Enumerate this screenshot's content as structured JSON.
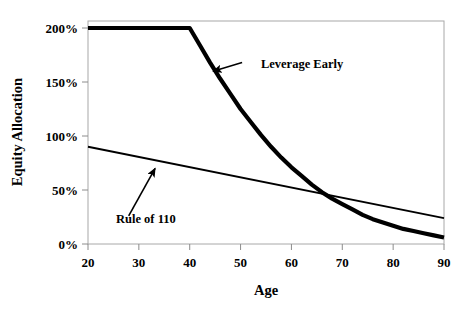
{
  "chart_data": {
    "type": "line",
    "title": "",
    "xlabel": "Age",
    "ylabel": "Equity Allocation",
    "xlim": [
      20,
      90
    ],
    "ylim": [
      0,
      200
    ],
    "grid": false,
    "legend_position": "none",
    "x_ticks": [
      20,
      30,
      40,
      50,
      60,
      70,
      80,
      90
    ],
    "x_tick_labels": [
      "20",
      "30",
      "40",
      "50",
      "60",
      "70",
      "80",
      "90"
    ],
    "y_ticks": [
      0,
      50,
      100,
      150,
      200
    ],
    "y_tick_labels": [
      "0%",
      "50%",
      "100%",
      "150%",
      "200%"
    ],
    "series": [
      {
        "name": "Leverage Early",
        "style": "thick",
        "x": [
          20,
          25,
          30,
          35,
          40,
          42,
          44,
          46,
          48,
          50,
          52,
          54,
          56,
          58,
          60,
          62,
          64,
          66,
          68,
          70,
          72,
          74,
          76,
          78,
          80,
          82,
          84,
          86,
          88,
          90
        ],
        "values": [
          200,
          200,
          200,
          200,
          200,
          184,
          168,
          153,
          139,
          125,
          113,
          101,
          90,
          80,
          71,
          63,
          55,
          48,
          42,
          37,
          32,
          27,
          23,
          20,
          17,
          14,
          12,
          10,
          8,
          6
        ]
      },
      {
        "name": "Rule of 110",
        "style": "thin",
        "x": [
          20,
          90
        ],
        "values": [
          90,
          24
        ]
      }
    ],
    "annotations": [
      {
        "text": "Leverage Early",
        "text_x": 54.0,
        "text_y": 163,
        "arrow_from_x": 50.3,
        "arrow_from_y": 168,
        "arrow_to_x": 44.6,
        "arrow_to_y": 160
      },
      {
        "text": "Rule of 110",
        "text_x": 25.5,
        "text_y": 19,
        "arrow_from_x": 28.0,
        "arrow_from_y": 26,
        "arrow_to_x": 33.2,
        "arrow_to_y": 70
      }
    ]
  }
}
